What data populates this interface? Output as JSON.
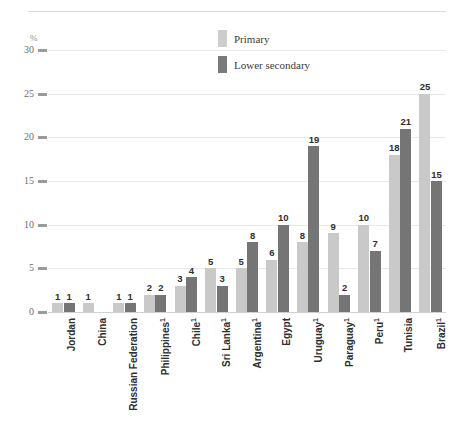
{
  "chart_data": {
    "type": "bar",
    "title": "",
    "xlabel": "",
    "ylabel": "%",
    "ylim": [
      0,
      30
    ],
    "yticks": [
      0,
      5,
      10,
      15,
      20,
      25,
      30
    ],
    "grid": true,
    "legend_position": "top-center",
    "categories": [
      "Jordan",
      "China",
      "Russian Federation",
      "Philippines¹",
      "Chile¹",
      "Sri Lanka¹",
      "Argentina¹",
      "Egypt",
      "Uruguay¹",
      "Paraguay¹",
      "Peru¹",
      "Tunisia",
      "Brazil¹"
    ],
    "series": [
      {
        "name": "Primary",
        "color": "#c9c9c9",
        "values": [
          1,
          1,
          1,
          2,
          3,
          5,
          5,
          6,
          8,
          9,
          10,
          18,
          25
        ]
      },
      {
        "name": "Lower secondary",
        "color": "#757575",
        "values": [
          1,
          null,
          1,
          2,
          4,
          3,
          8,
          10,
          19,
          2,
          7,
          21,
          15
        ]
      }
    ]
  },
  "axis": {
    "unit_label": "%",
    "tick_labels": [
      "30",
      "25",
      "20",
      "15",
      "10",
      "5",
      "0"
    ]
  },
  "legend": {
    "items": [
      {
        "label": "Primary",
        "swatch": "primary"
      },
      {
        "label": "Lower secondary",
        "swatch": "secondary"
      }
    ]
  },
  "header": {
    "clipped_text": ""
  }
}
